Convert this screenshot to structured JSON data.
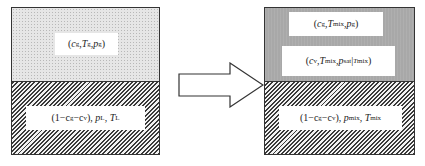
{
  "diagram": {
    "type": "phase-transition-schematic",
    "left_state": {
      "top_region": {
        "fill": "dotted-light-gray",
        "label": {
          "open": "(",
          "c": "c",
          "c_sub": "g",
          "sep1": ",",
          "T": "T",
          "T_sub": "g",
          "sep2": ",",
          "p": "p",
          "p_sub": "g",
          "close": ")"
        }
      },
      "bottom_region": {
        "fill": "diagonal-hatch",
        "label": {
          "prefix": "(1−c",
          "c_sub1": "g",
          "mid": "−c",
          "c_sub2": "v",
          "suffix": "), ",
          "p": "p",
          "p_sub": "L",
          "sep": ", ",
          "T": "T",
          "T_sub": "L"
        }
      }
    },
    "arrow": {
      "direction": "right",
      "style": "outlined-block-arrow"
    },
    "right_state": {
      "top_region": {
        "fill": "medium-gray",
        "label1": {
          "open": "(",
          "c": "c",
          "c_sub": "g",
          "sep1": ",",
          "T": "T",
          "T_sub": "mix",
          "sep2": ", ",
          "p": "p",
          "p_sub": "g",
          "close": ")"
        },
        "label2": {
          "open": "(",
          "c": "c",
          "c_sub": "v",
          "sep1": ",",
          "T": "T",
          "T_sub": "mix",
          "sep2": ", ",
          "p": "p",
          "p_sub": "sat",
          "bar": " | ",
          "T2": "T",
          "T2_sub": "mix",
          "close": ")"
        }
      },
      "bottom_region": {
        "fill": "diagonal-hatch",
        "label": {
          "prefix": "(1−c",
          "c_sub1": "g",
          "mid": "−c",
          "c_sub2": "v",
          "suffix": "), ",
          "p": "p",
          "p_sub": "mix",
          "sep": ", ",
          "T": "T",
          "T_sub": "mix"
        }
      }
    },
    "colors": {
      "border": "#333333",
      "dotted_bg": "#e6e6e6",
      "gray_bg": "#a8a8a8",
      "hatch": "#3a3a3a",
      "label_bg": "#ffffff"
    }
  }
}
